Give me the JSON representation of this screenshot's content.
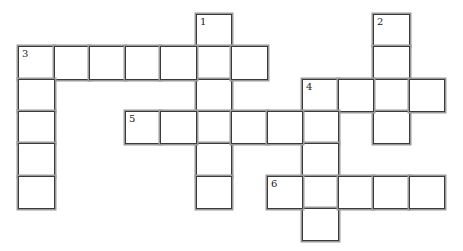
{
  "puzzle": {
    "type": "crossword",
    "grid": {
      "cols": 12,
      "rows": 7,
      "origin_x": 18,
      "origin_y": 14,
      "cell_w": 35.5,
      "cell_h": 32.3
    },
    "colors": {
      "cell_bg": "#ffffff",
      "border": "#3a3a3a",
      "shadow": "#9a9a9a"
    },
    "entries": [
      {
        "number": "1",
        "direction": "down",
        "row": 0,
        "col": 5,
        "length": 6
      },
      {
        "number": "2",
        "direction": "down",
        "row": 0,
        "col": 10,
        "length": 4
      },
      {
        "number": "3",
        "direction": "across",
        "row": 1,
        "col": 0,
        "length": 7
      },
      {
        "number": "3",
        "direction": "down",
        "row": 1,
        "col": 0,
        "length": 5
      },
      {
        "number": "4",
        "direction": "across",
        "row": 2,
        "col": 8,
        "length": 4
      },
      {
        "number": "4",
        "direction": "down",
        "row": 2,
        "col": 8,
        "length": 5
      },
      {
        "number": "5",
        "direction": "across",
        "row": 3,
        "col": 3,
        "length": 6
      },
      {
        "number": "6",
        "direction": "across",
        "row": 5,
        "col": 7,
        "length": 5
      }
    ],
    "letters": {}
  }
}
